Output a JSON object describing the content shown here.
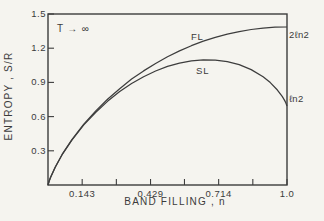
{
  "figure_title": "Entropy vs band filling figure",
  "colors": {
    "ink": "#3d3d3d",
    "paper": "#f5f4ef"
  },
  "chart_data": {
    "type": "line",
    "title": "",
    "xlabel": "BAND FILLING , n",
    "ylabel": "ENTROPY , S/R",
    "xlim": [
      0,
      1.0
    ],
    "ylim": [
      0,
      1.5
    ],
    "grid": false,
    "legend": "curve labels inline (FL above upper curve, SL above lower curve)",
    "x_ticks": [
      {
        "v": 0.143,
        "label": "0.143"
      },
      {
        "v": 0.429,
        "label": "0.429"
      },
      {
        "v": 0.714,
        "label": "0.714"
      },
      {
        "v": 1.0,
        "label": "1.0"
      }
    ],
    "x_minor_ticks": [
      0.286,
      0.571,
      0.857
    ],
    "y_ticks": [
      {
        "v": 1.5,
        "label": "1.5"
      },
      {
        "v": 1.2,
        "label": "1.2"
      },
      {
        "v": 0.9,
        "label": "0.9"
      },
      {
        "v": 0.6,
        "label": "0.6"
      },
      {
        "v": 0.3,
        "label": "0.3"
      }
    ],
    "annotations": {
      "temperature": "T → ∞",
      "fl": "FL",
      "sl": "SL",
      "two_ln2": "2ℓn2",
      "ln2": "ℓn2"
    },
    "series": [
      {
        "name": "FL",
        "end_value_label": "2ℓn2",
        "points": [
          [
            0,
            0
          ],
          [
            0.005,
            0.035
          ],
          [
            0.01,
            0.063
          ],
          [
            0.03,
            0.156
          ],
          [
            0.06,
            0.27
          ],
          [
            0.1,
            0.397
          ],
          [
            0.15,
            0.533
          ],
          [
            0.2,
            0.65
          ],
          [
            0.25,
            0.754
          ],
          [
            0.3,
            0.845
          ],
          [
            0.35,
            0.93
          ],
          [
            0.4,
            1.001
          ],
          [
            0.45,
            1.066
          ],
          [
            0.5,
            1.125
          ],
          [
            0.55,
            1.176
          ],
          [
            0.6,
            1.222
          ],
          [
            0.65,
            1.261
          ],
          [
            0.7,
            1.295
          ],
          [
            0.75,
            1.323
          ],
          [
            0.8,
            1.346
          ],
          [
            0.85,
            1.364
          ],
          [
            0.9,
            1.376
          ],
          [
            0.95,
            1.384
          ],
          [
            1.0,
            1.386
          ]
        ]
      },
      {
        "name": "SL",
        "end_value_label": "ℓn2",
        "points": [
          [
            0,
            0
          ],
          [
            0.005,
            0.035
          ],
          [
            0.01,
            0.063
          ],
          [
            0.03,
            0.156
          ],
          [
            0.06,
            0.269
          ],
          [
            0.1,
            0.394
          ],
          [
            0.15,
            0.527
          ],
          [
            0.2,
            0.639
          ],
          [
            0.25,
            0.736
          ],
          [
            0.3,
            0.819
          ],
          [
            0.35,
            0.89
          ],
          [
            0.4,
            0.95
          ],
          [
            0.45,
            1.0
          ],
          [
            0.5,
            1.04
          ],
          [
            0.55,
            1.069
          ],
          [
            0.6,
            1.089
          ],
          [
            0.65,
            1.098
          ],
          [
            0.7,
            1.096
          ],
          [
            0.75,
            1.082
          ],
          [
            0.8,
            1.055
          ],
          [
            0.85,
            1.012
          ],
          [
            0.9,
            0.949
          ],
          [
            0.93,
            0.898
          ],
          [
            0.96,
            0.833
          ],
          [
            0.98,
            0.777
          ],
          [
            0.99,
            0.742
          ],
          [
            0.995,
            0.721
          ],
          [
            1.0,
            0.693
          ]
        ]
      }
    ]
  }
}
